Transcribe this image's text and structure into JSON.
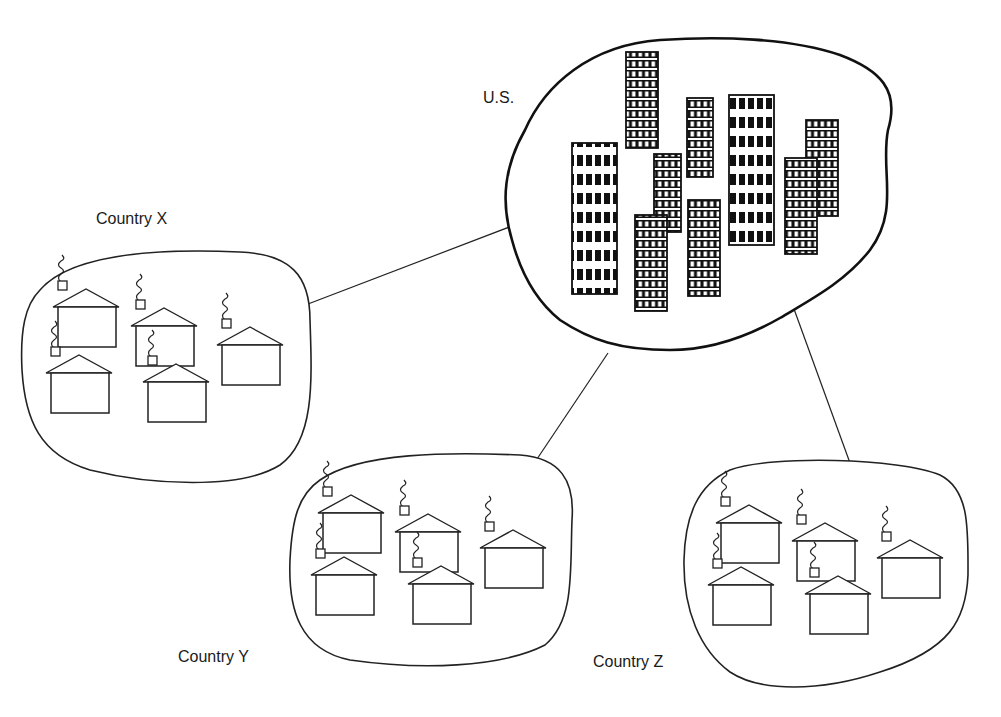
{
  "diagram": {
    "hub": {
      "label": "U.S.",
      "type": "industrialized-city",
      "buildings": 9
    },
    "nodes": [
      {
        "label": "Country X",
        "type": "rural-village",
        "houses": 5
      },
      {
        "label": "Country Y",
        "type": "rural-village",
        "houses": 5
      },
      {
        "label": "Country Z",
        "type": "rural-village",
        "houses": 5
      }
    ],
    "connections": [
      {
        "from": "U.S.",
        "to": "Country X"
      },
      {
        "from": "U.S.",
        "to": "Country Y"
      },
      {
        "from": "U.S.",
        "to": "Country Z"
      }
    ]
  }
}
